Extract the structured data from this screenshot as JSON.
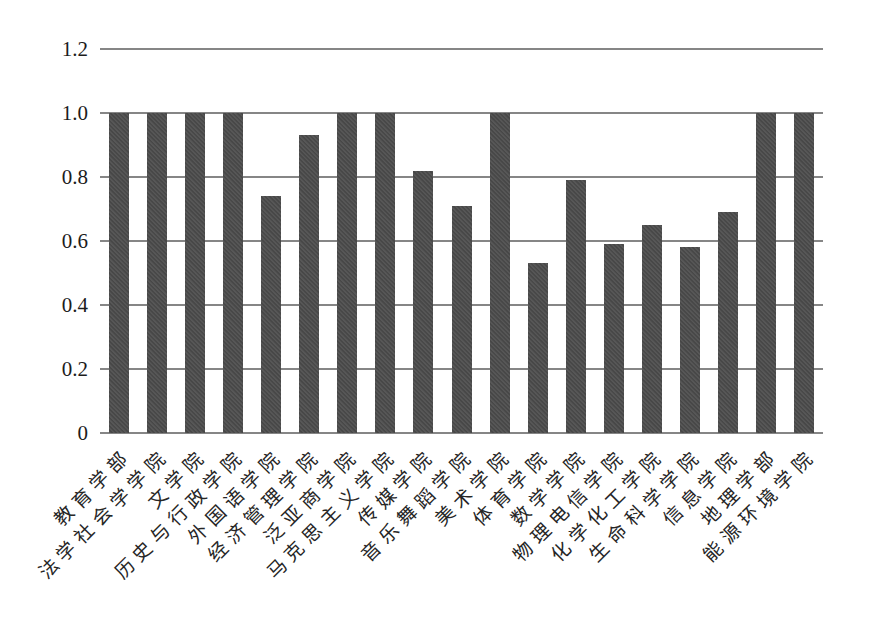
{
  "chart_data": {
    "type": "bar",
    "title": "",
    "xlabel": "",
    "ylabel": "",
    "categories": [
      "教育学部",
      "法学社会学学院",
      "文学院",
      "历史与行政学院",
      "外国语学院",
      "经济管理学院",
      "泛亚商学院",
      "马克思主义学院",
      "传媒学院",
      "音乐舞蹈学院",
      "美术学院",
      "体育学院",
      "数学学院",
      "物理电信学院",
      "化学化工学院",
      "生命科学学院",
      "信息学院",
      "地理学部",
      "能源环境学院"
    ],
    "values": [
      1.0,
      1.0,
      1.0,
      1.0,
      0.74,
      0.93,
      1.0,
      1.0,
      0.82,
      0.71,
      1.0,
      0.53,
      0.79,
      0.59,
      0.65,
      0.58,
      0.69,
      1.0,
      1.0
    ],
    "ylim": [
      0,
      1.2
    ],
    "yticks": [
      0,
      0.2,
      0.4,
      0.6,
      0.8,
      1.0,
      1.2
    ],
    "ytick_labels": [
      "0",
      "0.2",
      "0.4",
      "0.6",
      "0.8",
      "1.0",
      "1.2"
    ],
    "grid": true,
    "legend": false,
    "x_label_rotation_deg": 45,
    "colors": {
      "bar": "#4a4a4a",
      "gridline": "#868686",
      "background": "#ffffff",
      "tick_text": "#1c1c1c"
    }
  }
}
